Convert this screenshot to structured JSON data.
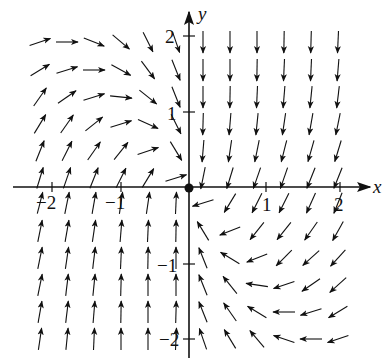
{
  "figure": {
    "type": "vector-field",
    "axes": {
      "x_label": "x",
      "y_label": "y",
      "x_ticks": [
        "−2",
        "−1",
        "1",
        "2"
      ],
      "y_ticks": [
        "2",
        "1",
        "−1",
        "−2"
      ],
      "origin_marker": "filled-dot"
    },
    "colors": {
      "ink": "#111111",
      "background": "#ffffff"
    },
    "arrow_length_px": 22,
    "columns_left_px": [
      40,
      67,
      94,
      121,
      148,
      176
    ],
    "columns_right_px": [
      203,
      230,
      257,
      284,
      311,
      338
    ],
    "rows_top_px": [
      42,
      70,
      97,
      124,
      151,
      178
    ],
    "rows_bottom_px": [
      203,
      231,
      258,
      285,
      312,
      339
    ],
    "quadrant_top_left": [
      [
        [
          1,
          -0.35
        ],
        [
          1,
          0
        ],
        [
          1,
          0.4
        ],
        [
          1,
          0.85
        ],
        [
          0.5,
          1
        ],
        [
          0.35,
          1
        ]
      ],
      [
        [
          1,
          -0.6
        ],
        [
          1,
          -0.3
        ],
        [
          1,
          0
        ],
        [
          1,
          0.55
        ],
        [
          0.75,
          1
        ],
        [
          0.4,
          1
        ]
      ],
      [
        [
          0.7,
          -1
        ],
        [
          1,
          -0.7
        ],
        [
          1,
          -0.3
        ],
        [
          1,
          0.1
        ],
        [
          1,
          0.8
        ],
        [
          0.4,
          1
        ]
      ],
      [
        [
          0.6,
          -1
        ],
        [
          0.7,
          -1
        ],
        [
          1,
          -0.8
        ],
        [
          1,
          -0.3
        ],
        [
          1,
          0.45
        ],
        [
          0.5,
          1
        ]
      ],
      [
        [
          0.4,
          -1
        ],
        [
          0.5,
          -1
        ],
        [
          0.7,
          -1
        ],
        [
          0.8,
          -1
        ],
        [
          1,
          -0.35
        ],
        [
          0.6,
          1
        ]
      ],
      [
        [
          0.3,
          -1
        ],
        [
          0.35,
          -1
        ],
        [
          0.4,
          -1
        ],
        [
          0.5,
          -1
        ],
        [
          0.6,
          -1
        ],
        [
          1,
          -0.3
        ]
      ]
    ],
    "quadrant_top_right": [
      [
        [
          0,
          1
        ],
        [
          0,
          1
        ],
        [
          0,
          1
        ],
        [
          -0.02,
          1
        ],
        [
          -0.03,
          1
        ],
        [
          -0.05,
          1
        ]
      ],
      [
        [
          0,
          1
        ],
        [
          0,
          1
        ],
        [
          -0.02,
          1
        ],
        [
          -0.05,
          1
        ],
        [
          -0.05,
          1
        ],
        [
          -0.08,
          1
        ]
      ],
      [
        [
          0,
          1
        ],
        [
          -0.02,
          1
        ],
        [
          -0.05,
          1
        ],
        [
          -0.08,
          1
        ],
        [
          -0.1,
          1
        ],
        [
          -0.12,
          1
        ]
      ],
      [
        [
          -0.03,
          1
        ],
        [
          -0.08,
          1
        ],
        [
          -0.1,
          1
        ],
        [
          -0.15,
          1
        ],
        [
          -0.18,
          1
        ],
        [
          -0.2,
          1
        ]
      ],
      [
        [
          -0.08,
          1
        ],
        [
          -0.15,
          1
        ],
        [
          -0.2,
          1
        ],
        [
          -0.25,
          1
        ],
        [
          -0.28,
          1
        ],
        [
          -0.3,
          1
        ]
      ],
      [
        [
          -0.2,
          1
        ],
        [
          -0.3,
          1
        ],
        [
          -0.35,
          1
        ],
        [
          -0.35,
          1
        ],
        [
          -0.4,
          1
        ],
        [
          -0.4,
          1
        ]
      ]
    ],
    "quadrant_bottom_left": [
      [
        [
          0.25,
          -1
        ],
        [
          0.2,
          -1
        ],
        [
          0.18,
          -1
        ],
        [
          0.15,
          -1
        ],
        [
          0.15,
          -1
        ],
        [
          0.05,
          -1
        ]
      ],
      [
        [
          0.2,
          -1
        ],
        [
          0.18,
          -1
        ],
        [
          0.15,
          -1
        ],
        [
          0.08,
          -1
        ],
        [
          0.05,
          -1
        ],
        [
          0.02,
          -1
        ]
      ],
      [
        [
          0.2,
          -1
        ],
        [
          0.15,
          -1
        ],
        [
          0.12,
          -1
        ],
        [
          0.05,
          -1
        ],
        [
          0.02,
          -1
        ],
        [
          0,
          -1
        ]
      ],
      [
        [
          0.2,
          -1
        ],
        [
          0.12,
          -1
        ],
        [
          0.1,
          -1
        ],
        [
          0.03,
          -1
        ],
        [
          0,
          -1
        ],
        [
          0,
          -1
        ]
      ],
      [
        [
          0.18,
          -1
        ],
        [
          0.12,
          -1
        ],
        [
          0.08,
          -1
        ],
        [
          0.02,
          -1
        ],
        [
          0,
          -1
        ],
        [
          0.03,
          -1
        ]
      ],
      [
        [
          0.15,
          -1
        ],
        [
          0.1,
          -1
        ],
        [
          0.05,
          -1
        ],
        [
          0,
          -1
        ],
        [
          0,
          -1
        ],
        [
          0.05,
          -1
        ]
      ]
    ],
    "quadrant_bottom_right": [
      [
        [
          -1,
          0.3
        ],
        [
          -0.6,
          1
        ],
        [
          -0.5,
          1
        ],
        [
          -0.5,
          1
        ],
        [
          -0.45,
          1
        ],
        [
          -0.4,
          1
        ]
      ],
      [
        [
          -0.6,
          -1
        ],
        [
          -1,
          0.4
        ],
        [
          -0.8,
          1
        ],
        [
          -0.8,
          1
        ],
        [
          -0.7,
          1
        ],
        [
          -0.55,
          1
        ]
      ],
      [
        [
          -0.4,
          -1
        ],
        [
          -1,
          -0.6
        ],
        [
          -1,
          0.4
        ],
        [
          -1,
          1
        ],
        [
          -1,
          0.9
        ],
        [
          -0.9,
          1
        ]
      ],
      [
        [
          -0.4,
          -1
        ],
        [
          -0.8,
          -1
        ],
        [
          -1,
          -0.15
        ],
        [
          -1,
          0.35
        ],
        [
          -1,
          0.7
        ],
        [
          -1,
          0.9
        ]
      ],
      [
        [
          -0.4,
          -1
        ],
        [
          -0.7,
          -1
        ],
        [
          -1,
          -0.6
        ],
        [
          -1,
          0
        ],
        [
          -1,
          0.3
        ],
        [
          -1,
          0.6
        ]
      ],
      [
        [
          -0.35,
          -1
        ],
        [
          -0.6,
          -1
        ],
        [
          -0.85,
          -1
        ],
        [
          -1,
          -0.35
        ],
        [
          -1,
          0
        ],
        [
          -1,
          0.35
        ]
      ]
    ]
  }
}
